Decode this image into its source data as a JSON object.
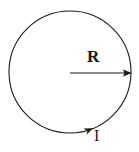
{
  "figure": {
    "type": "physics-diagram",
    "background_color": "#ffffff",
    "stroke_color": "#1a1a1a",
    "labels": {
      "radius": "R",
      "current": "I"
    },
    "circle": {
      "center_x": 70,
      "center_y": 72,
      "radius": 61,
      "stroke_width": 1.1
    },
    "radius_arrow": {
      "start_x": 70,
      "start_y": 73,
      "end_x": 131,
      "end_y": 73,
      "stroke_width": 1.1,
      "arrowhead": "filled-triangle"
    },
    "current_arrow": {
      "x": 88,
      "y": 131,
      "direction_deg": -28,
      "arrowhead": "filled-triangle"
    }
  }
}
